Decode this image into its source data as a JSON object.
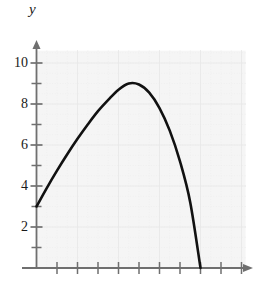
{
  "chart_data": {
    "type": "line",
    "title": "",
    "xlabel": "",
    "ylabel": "y",
    "xlim": [
      0,
      11
    ],
    "ylim": [
      0,
      11
    ],
    "grid": true,
    "legend": null,
    "shaded_region": {
      "present": true,
      "description": "region between curve and x-axis from x=0 to x=8",
      "color": "#f1f1f1"
    },
    "curve": {
      "name": "parabola",
      "color": "#111111",
      "x": [
        0,
        0.5,
        1,
        1.5,
        2,
        2.5,
        3,
        3.5,
        4,
        4.5,
        5,
        5.5,
        6,
        6.5,
        7,
        7.5,
        8
      ],
      "y": [
        3.0,
        3.9,
        4.75,
        5.55,
        6.3,
        7.0,
        7.65,
        8.2,
        8.7,
        9.0,
        8.95,
        8.55,
        7.8,
        6.7,
        5.2,
        3.2,
        0.0
      ],
      "start_point": [
        0,
        3
      ],
      "peak_point": [
        4.5,
        9
      ],
      "x_intercept": [
        8,
        0
      ]
    },
    "y_axis": {
      "tick_labels": [
        "10",
        "8",
        "6",
        "4",
        "2"
      ],
      "tick_values": [
        10,
        8,
        6,
        4,
        2
      ],
      "minor_tick_values": [
        1,
        3,
        5,
        7,
        9
      ],
      "arrow": "up"
    },
    "x_axis": {
      "tick_labels": [],
      "tick_values": [
        1,
        2,
        3,
        4,
        5,
        6,
        7,
        8,
        9,
        10
      ],
      "arrow": "right"
    },
    "colors": {
      "curve": "#111111",
      "axis": "#6f6f6f",
      "grid_major": "#c9c9c9",
      "grid_minor": "#dedede",
      "fill": "#f1f1f1",
      "text": "#1a1a1a"
    }
  }
}
